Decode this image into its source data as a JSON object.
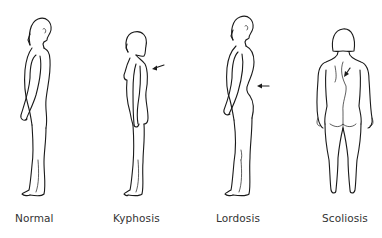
{
  "diagram": {
    "type": "posture-comparison",
    "figures": [
      {
        "id": "normal",
        "label": "Normal",
        "view": "side",
        "arrow": false,
        "label_x": 15
      },
      {
        "id": "kyphosis",
        "label": "Kyphosis",
        "view": "side",
        "arrow": true,
        "arrow_target": "upper back",
        "label_x": 113
      },
      {
        "id": "lordosis",
        "label": "Lordosis",
        "view": "side",
        "arrow": true,
        "arrow_target": "lower back",
        "label_x": 216
      },
      {
        "id": "scoliosis",
        "label": "Scoliosis",
        "view": "back",
        "arrow": true,
        "arrow_target": "curved spine",
        "label_x": 322
      }
    ],
    "colors": {
      "line": "#1a1a1a",
      "label": "#333333",
      "background": "#ffffff"
    }
  }
}
